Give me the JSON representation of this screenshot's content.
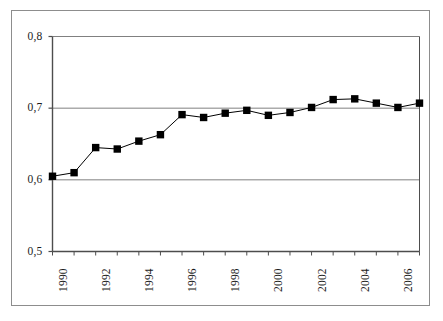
{
  "chart_data": {
    "type": "line",
    "title": "",
    "subtitle": "",
    "xlabel": "",
    "ylabel": "",
    "x": [
      1990,
      1991,
      1992,
      1993,
      1994,
      1995,
      1996,
      1997,
      1998,
      1999,
      2000,
      2001,
      2002,
      2003,
      2004,
      2005,
      2006,
      2007
    ],
    "values": [
      0.605,
      0.61,
      0.645,
      0.643,
      0.654,
      0.663,
      0.691,
      0.687,
      0.693,
      0.697,
      0.69,
      0.694,
      0.701,
      0.712,
      0.713,
      0.707,
      0.701,
      0.707
    ],
    "series": [
      {
        "name": "",
        "marker": "square",
        "marker_color": "#000000",
        "line_color": "#000000",
        "values": [
          0.605,
          0.61,
          0.645,
          0.643,
          0.654,
          0.663,
          0.691,
          0.687,
          0.693,
          0.697,
          0.69,
          0.694,
          0.701,
          0.712,
          0.713,
          0.707,
          0.701,
          0.707
        ]
      }
    ],
    "ylim": [
      0.5,
      0.8
    ],
    "xlim": [
      1990,
      2007
    ],
    "y_ticks": [
      0.5,
      0.6,
      0.7,
      0.8
    ],
    "y_tick_labels": [
      "0,5",
      "0,6",
      "0,7",
      "0,8"
    ],
    "x_ticks": [
      1990,
      1991,
      1992,
      1993,
      1994,
      1995,
      1996,
      1997,
      1998,
      1999,
      2000,
      2001,
      2002,
      2003,
      2004,
      2005,
      2006,
      2007
    ],
    "x_tick_labels": [
      "1990",
      "",
      "1992",
      "",
      "1994",
      "",
      "1996",
      "",
      "1998",
      "",
      "2000",
      "",
      "2002",
      "",
      "2004",
      "",
      "2006",
      ""
    ],
    "x_tick_labels_rotation": -90,
    "grid": {
      "horizontal": true,
      "vertical": false,
      "color": "#808080"
    },
    "legend": {
      "visible": false,
      "position": "none",
      "entries": []
    },
    "axis_color": "#4d4d4d",
    "plot_border": true,
    "background_color": "#ffffff"
  },
  "figure": {
    "outer_frame_color": "#8d8d8d"
  }
}
